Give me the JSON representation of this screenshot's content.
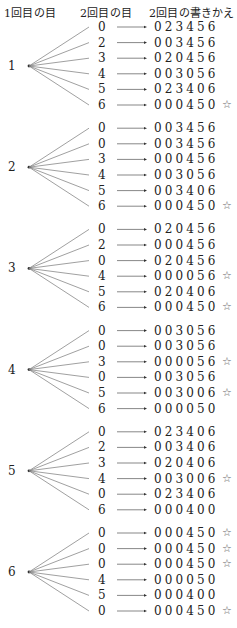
{
  "headers": {
    "first_roll": "1回目の目",
    "second_roll": "2回目の目",
    "rewrite": "2回目の書きかえ"
  },
  "star_symbol": "☆",
  "groups": [
    {
      "first": "1",
      "rows": [
        {
          "second": "0",
          "result": "023456",
          "star": false
        },
        {
          "second": "2",
          "result": "003456",
          "star": false
        },
        {
          "second": "3",
          "result": "020456",
          "star": false
        },
        {
          "second": "4",
          "result": "003056",
          "star": false
        },
        {
          "second": "5",
          "result": "023406",
          "star": false
        },
        {
          "second": "6",
          "result": "000450",
          "star": true
        }
      ]
    },
    {
      "first": "2",
      "rows": [
        {
          "second": "0",
          "result": "003456",
          "star": false
        },
        {
          "second": "0",
          "result": "003456",
          "star": false
        },
        {
          "second": "3",
          "result": "000456",
          "star": false
        },
        {
          "second": "4",
          "result": "003056",
          "star": false
        },
        {
          "second": "5",
          "result": "003406",
          "star": false
        },
        {
          "second": "6",
          "result": "000450",
          "star": true
        }
      ]
    },
    {
      "first": "3",
      "rows": [
        {
          "second": "0",
          "result": "020456",
          "star": false
        },
        {
          "second": "2",
          "result": "000456",
          "star": false
        },
        {
          "second": "0",
          "result": "020456",
          "star": false
        },
        {
          "second": "4",
          "result": "000056",
          "star": true
        },
        {
          "second": "5",
          "result": "020406",
          "star": false
        },
        {
          "second": "6",
          "result": "000450",
          "star": true
        }
      ]
    },
    {
      "first": "4",
      "rows": [
        {
          "second": "0",
          "result": "003056",
          "star": false
        },
        {
          "second": "0",
          "result": "003056",
          "star": false
        },
        {
          "second": "3",
          "result": "000056",
          "star": true
        },
        {
          "second": "0",
          "result": "003056",
          "star": false
        },
        {
          "second": "5",
          "result": "003006",
          "star": true
        },
        {
          "second": "6",
          "result": "000050",
          "star": false
        }
      ]
    },
    {
      "first": "5",
      "rows": [
        {
          "second": "0",
          "result": "023406",
          "star": false
        },
        {
          "second": "2",
          "result": "003406",
          "star": false
        },
        {
          "second": "3",
          "result": "020406",
          "star": false
        },
        {
          "second": "4",
          "result": "003006",
          "star": true
        },
        {
          "second": "0",
          "result": "023406",
          "star": false
        },
        {
          "second": "6",
          "result": "000400",
          "star": false
        }
      ]
    },
    {
      "first": "6",
      "rows": [
        {
          "second": "0",
          "result": "000450",
          "star": true
        },
        {
          "second": "0",
          "result": "000450",
          "star": true
        },
        {
          "second": "0",
          "result": "000450",
          "star": true
        },
        {
          "second": "4",
          "result": "000050",
          "star": false
        },
        {
          "second": "5",
          "result": "000400",
          "star": false
        },
        {
          "second": "0",
          "result": "000450",
          "star": true
        }
      ]
    }
  ]
}
